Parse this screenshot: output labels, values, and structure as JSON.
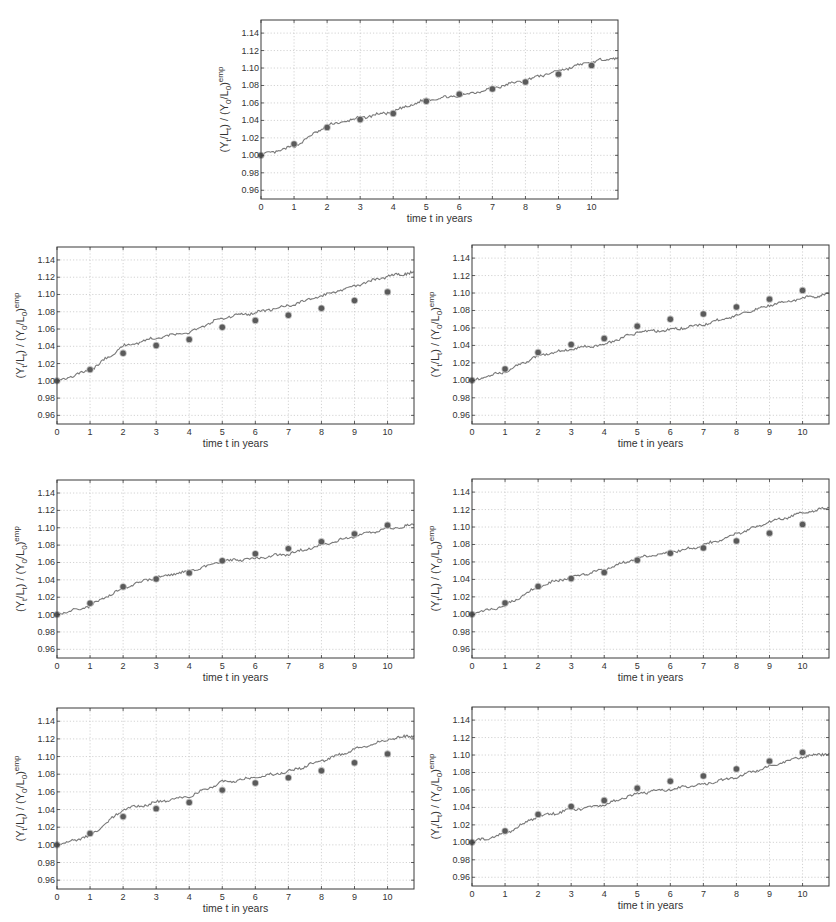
{
  "chart_data": [
    {
      "id": "top",
      "type": "line",
      "title": "",
      "xlabel": "time t in years",
      "ylabel": "(Y_t/L_t) / (Y_0/L_0)^emp",
      "xlim": [
        0,
        10.8
      ],
      "ylim": [
        0.95,
        1.155
      ],
      "xticks": [
        0,
        1,
        2,
        3,
        4,
        5,
        6,
        7,
        8,
        9,
        10
      ],
      "yticks": [
        0.96,
        0.98,
        1.0,
        1.02,
        1.04,
        1.06,
        1.08,
        1.1,
        1.12,
        1.14
      ],
      "ytick_labels": [
        "0.96",
        "0.98",
        "1.00",
        "1.02",
        "1.04",
        "1.06",
        "1.08",
        "1.10",
        "1.12",
        "1.14"
      ],
      "grid": true,
      "legend": null,
      "series": [
        {
          "name": "simulated",
          "kind": "line",
          "x": [
            0,
            1,
            2,
            3,
            4,
            5,
            6,
            7,
            8,
            9,
            10,
            10.8
          ],
          "values": [
            1.0,
            1.01,
            1.034,
            1.043,
            1.05,
            1.064,
            1.068,
            1.077,
            1.086,
            1.097,
            1.107,
            1.112
          ]
        },
        {
          "name": "empirical",
          "kind": "scatter",
          "x": [
            0,
            1,
            2,
            3,
            4,
            5,
            6,
            7,
            8,
            9,
            10
          ],
          "values": [
            1.0,
            1.013,
            1.032,
            1.041,
            1.048,
            1.062,
            1.07,
            1.076,
            1.084,
            1.093,
            1.103
          ]
        }
      ]
    },
    {
      "id": "row2-left",
      "type": "line",
      "title": "",
      "xlabel": "time t in years",
      "ylabel": "(Y_t/L_t) / (Y_0/L_0)^emp",
      "xlim": [
        0,
        10.8
      ],
      "ylim": [
        0.95,
        1.155
      ],
      "xticks": [
        0,
        1,
        2,
        3,
        4,
        5,
        6,
        7,
        8,
        9,
        10
      ],
      "yticks": [
        0.96,
        0.98,
        1.0,
        1.02,
        1.04,
        1.06,
        1.08,
        1.1,
        1.12,
        1.14
      ],
      "ytick_labels": [
        "0.96",
        "0.98",
        "1.00",
        "1.02",
        "1.04",
        "1.06",
        "1.08",
        "1.10",
        "1.12",
        "1.14"
      ],
      "grid": true,
      "legend": null,
      "series": [
        {
          "name": "simulated",
          "kind": "line",
          "x": [
            0,
            1,
            2,
            3,
            4,
            5,
            6,
            7,
            8,
            9,
            10,
            10.8
          ],
          "values": [
            1.0,
            1.012,
            1.04,
            1.05,
            1.056,
            1.073,
            1.079,
            1.087,
            1.098,
            1.11,
            1.121,
            1.126
          ]
        },
        {
          "name": "empirical",
          "kind": "scatter",
          "x": [
            0,
            1,
            2,
            3,
            4,
            5,
            6,
            7,
            8,
            9,
            10
          ],
          "values": [
            1.0,
            1.013,
            1.032,
            1.041,
            1.048,
            1.062,
            1.07,
            1.076,
            1.084,
            1.093,
            1.103
          ]
        }
      ]
    },
    {
      "id": "row2-right",
      "type": "line",
      "title": "",
      "xlabel": "time t in years",
      "ylabel": "(Y_t/L_t) / (Y_0/L_0)^emp",
      "xlim": [
        0,
        10.8
      ],
      "ylim": [
        0.95,
        1.155
      ],
      "xticks": [
        0,
        1,
        2,
        3,
        4,
        5,
        6,
        7,
        8,
        9,
        10
      ],
      "yticks": [
        0.96,
        0.98,
        1.0,
        1.02,
        1.04,
        1.06,
        1.08,
        1.1,
        1.12,
        1.14
      ],
      "ytick_labels": [
        "0.96",
        "0.98",
        "1.00",
        "1.02",
        "1.04",
        "1.06",
        "1.08",
        "1.10",
        "1.12",
        "1.14"
      ],
      "grid": true,
      "legend": null,
      "series": [
        {
          "name": "simulated",
          "kind": "line",
          "x": [
            0,
            1,
            2,
            3,
            4,
            5,
            6,
            7,
            8,
            9,
            10,
            10.8
          ],
          "values": [
            1.0,
            1.01,
            1.028,
            1.036,
            1.041,
            1.055,
            1.058,
            1.064,
            1.074,
            1.086,
            1.094,
            1.099
          ]
        },
        {
          "name": "empirical",
          "kind": "scatter",
          "x": [
            0,
            1,
            2,
            3,
            4,
            5,
            6,
            7,
            8,
            9,
            10
          ],
          "values": [
            1.0,
            1.013,
            1.032,
            1.041,
            1.048,
            1.062,
            1.07,
            1.076,
            1.084,
            1.093,
            1.103
          ]
        }
      ]
    },
    {
      "id": "row3-left",
      "type": "line",
      "title": "",
      "xlabel": "time t in years",
      "ylabel": "(Y_t/L_t) / (Y_0/L_0)^emp",
      "xlim": [
        0,
        10.8
      ],
      "ylim": [
        0.95,
        1.155
      ],
      "xticks": [
        0,
        1,
        2,
        3,
        4,
        5,
        6,
        7,
        8,
        9,
        10
      ],
      "yticks": [
        0.96,
        0.98,
        1.0,
        1.02,
        1.04,
        1.06,
        1.08,
        1.1,
        1.12,
        1.14
      ],
      "ytick_labels": [
        "0.96",
        "0.98",
        "1.00",
        "1.02",
        "1.04",
        "1.06",
        "1.08",
        "1.10",
        "1.12",
        "1.14"
      ],
      "grid": true,
      "legend": null,
      "series": [
        {
          "name": "simulated",
          "kind": "line",
          "x": [
            0,
            1,
            2,
            3,
            4,
            5,
            6,
            7,
            8,
            9,
            10,
            10.8
          ],
          "values": [
            1.0,
            1.01,
            1.031,
            1.043,
            1.05,
            1.061,
            1.065,
            1.07,
            1.08,
            1.09,
            1.099,
            1.103
          ]
        },
        {
          "name": "empirical",
          "kind": "scatter",
          "x": [
            0,
            1,
            2,
            3,
            4,
            5,
            6,
            7,
            8,
            9,
            10
          ],
          "values": [
            1.0,
            1.013,
            1.032,
            1.041,
            1.048,
            1.062,
            1.07,
            1.076,
            1.084,
            1.093,
            1.103
          ]
        }
      ]
    },
    {
      "id": "row3-right",
      "type": "line",
      "title": "",
      "xlabel": "time t in years",
      "ylabel": "(Y_t/L_t) / (Y_0/L_0)^emp",
      "xlim": [
        0,
        10.8
      ],
      "ylim": [
        0.95,
        1.155
      ],
      "xticks": [
        0,
        1,
        2,
        3,
        4,
        5,
        6,
        7,
        8,
        9,
        10
      ],
      "yticks": [
        0.96,
        0.98,
        1.0,
        1.02,
        1.04,
        1.06,
        1.08,
        1.1,
        1.12,
        1.14
      ],
      "ytick_labels": [
        "0.96",
        "0.98",
        "1.00",
        "1.02",
        "1.04",
        "1.06",
        "1.08",
        "1.10",
        "1.12",
        "1.14"
      ],
      "grid": true,
      "legend": null,
      "series": [
        {
          "name": "simulated",
          "kind": "line",
          "x": [
            0,
            1,
            2,
            3,
            4,
            5,
            6,
            7,
            8,
            9,
            10,
            10.8
          ],
          "values": [
            1.0,
            1.01,
            1.032,
            1.043,
            1.051,
            1.065,
            1.071,
            1.079,
            1.092,
            1.106,
            1.116,
            1.122
          ]
        },
        {
          "name": "empirical",
          "kind": "scatter",
          "x": [
            0,
            1,
            2,
            3,
            4,
            5,
            6,
            7,
            8,
            9,
            10
          ],
          "values": [
            1.0,
            1.013,
            1.032,
            1.041,
            1.048,
            1.062,
            1.07,
            1.076,
            1.084,
            1.093,
            1.103
          ]
        }
      ]
    },
    {
      "id": "row4-left",
      "type": "line",
      "title": "",
      "xlabel": "time t in years",
      "ylabel": "(Y_t/L_t) / (Y_0/L_0)^emp",
      "xlim": [
        0,
        10.8
      ],
      "ylim": [
        0.95,
        1.155
      ],
      "xticks": [
        0,
        1,
        2,
        3,
        4,
        5,
        6,
        7,
        8,
        9,
        10
      ],
      "yticks": [
        0.96,
        0.98,
        1.0,
        1.02,
        1.04,
        1.06,
        1.08,
        1.1,
        1.12,
        1.14
      ],
      "ytick_labels": [
        "0.96",
        "0.98",
        "1.00",
        "1.02",
        "1.04",
        "1.06",
        "1.08",
        "1.10",
        "1.12",
        "1.14"
      ],
      "grid": true,
      "legend": null,
      "series": [
        {
          "name": "simulated",
          "kind": "line",
          "x": [
            0,
            1,
            2,
            3,
            4,
            5,
            6,
            7,
            8,
            9,
            10,
            10.8
          ],
          "values": [
            1.0,
            1.01,
            1.04,
            1.048,
            1.055,
            1.071,
            1.076,
            1.083,
            1.095,
            1.108,
            1.119,
            1.124
          ]
        },
        {
          "name": "empirical",
          "kind": "scatter",
          "x": [
            0,
            1,
            2,
            3,
            4,
            5,
            6,
            7,
            8,
            9,
            10
          ],
          "values": [
            1.0,
            1.013,
            1.032,
            1.041,
            1.048,
            1.062,
            1.07,
            1.076,
            1.084,
            1.093,
            1.103
          ]
        }
      ]
    },
    {
      "id": "row4-right",
      "type": "line",
      "title": "",
      "xlabel": "time t in years",
      "ylabel": "(Y_t/L_t) / (Y_0/L_0)^emp",
      "xlim": [
        0,
        10.8
      ],
      "ylim": [
        0.95,
        1.155
      ],
      "xticks": [
        0,
        1,
        2,
        3,
        4,
        5,
        6,
        7,
        8,
        9,
        10
      ],
      "yticks": [
        0.96,
        0.98,
        1.0,
        1.02,
        1.04,
        1.06,
        1.08,
        1.1,
        1.12,
        1.14
      ],
      "ytick_labels": [
        "0.96",
        "0.98",
        "1.00",
        "1.02",
        "1.04",
        "1.06",
        "1.08",
        "1.10",
        "1.12",
        "1.14"
      ],
      "grid": true,
      "legend": null,
      "series": [
        {
          "name": "simulated",
          "kind": "line",
          "x": [
            0,
            1,
            2,
            3,
            4,
            5,
            6,
            7,
            8,
            9,
            10,
            10.8
          ],
          "values": [
            1.0,
            1.01,
            1.03,
            1.037,
            1.043,
            1.056,
            1.061,
            1.066,
            1.075,
            1.087,
            1.098,
            1.102
          ]
        },
        {
          "name": "empirical",
          "kind": "scatter",
          "x": [
            0,
            1,
            2,
            3,
            4,
            5,
            6,
            7,
            8,
            9,
            10
          ],
          "values": [
            1.0,
            1.013,
            1.032,
            1.041,
            1.048,
            1.062,
            1.07,
            1.076,
            1.084,
            1.093,
            1.103
          ]
        }
      ]
    }
  ],
  "labels": {
    "xlabel": "time t in years",
    "ylabel_parts": {
      "open": "(Y",
      "t1": "t",
      "mid1": "/L",
      "t2": "t",
      "mid2": ") / (Y",
      "z1": "0",
      "mid3": "/L",
      "z2": "0",
      "close": ")",
      "sup": "emp"
    }
  },
  "colors": {
    "line": "#7a7a7a",
    "marker": "#5a5a5a",
    "marker_halo": "#bdbdbd",
    "axes": "#3a3a3a",
    "grid": "#c8c8c8",
    "text": "#333333"
  }
}
